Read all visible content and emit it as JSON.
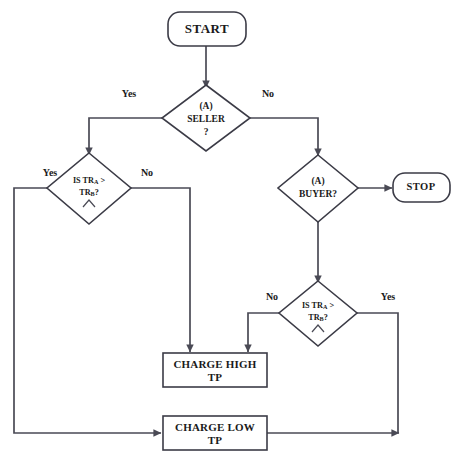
{
  "diagram": {
    "colors": {
      "background": "#ffffff",
      "shape_stroke": "#3b3b46",
      "connector_stroke": "#4a4a55",
      "text": "#1a1a1a"
    },
    "nodes": {
      "start": {
        "label": "START",
        "type": "terminal"
      },
      "stop": {
        "label": "STOP",
        "type": "terminal"
      },
      "seller": {
        "line1": "(A)",
        "line2": "SELLER",
        "line3": "?",
        "type": "decision"
      },
      "buyer": {
        "line1": "(A)",
        "line2": "BUYER?",
        "type": "decision"
      },
      "compare_left": {
        "line1_a": "IS TR",
        "line1_sub": "A",
        "line1_b": " >",
        "line2_a": "TR",
        "line2_sub": "B",
        "line2_b": "?",
        "caret": "^",
        "type": "decision"
      },
      "compare_right": {
        "line1_a": "IS TR",
        "line1_sub": "A",
        "line1_b": " >",
        "line2_a": "TR",
        "line2_sub": "B",
        "line2_b": "?",
        "caret": "^",
        "type": "decision"
      },
      "charge_high": {
        "line1": "CHARGE HIGH",
        "line2": "TP",
        "type": "process"
      },
      "charge_low": {
        "line1": "CHARGE LOW",
        "line2": "TP",
        "type": "process"
      }
    },
    "edge_labels": {
      "seller_yes": "Yes",
      "seller_no": "No",
      "left_yes": "Yes",
      "left_no": "No",
      "right_no": "No",
      "right_yes": "Yes"
    }
  }
}
